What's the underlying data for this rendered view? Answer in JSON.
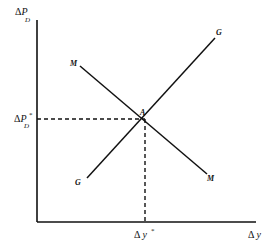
{
  "diagram": {
    "type": "economics-equilibrium",
    "colors": {
      "ink": "#111111",
      "background": "#ffffff"
    },
    "axes": {
      "y_label": {
        "delta": "Δ",
        "var": "P",
        "sub": "D"
      },
      "x_label": {
        "delta": "Δ",
        "var": "y"
      }
    },
    "curves": [
      {
        "id": "M",
        "label": "M",
        "label_end": "M",
        "direction": "downward-sloping"
      },
      {
        "id": "G",
        "label": "G",
        "label_end": "G",
        "direction": "upward-sloping"
      }
    ],
    "equilibrium": {
      "point_label": "A",
      "y_value_label": {
        "delta": "Δ",
        "var": "P",
        "sub": "D",
        "star": "*"
      },
      "x_value_label": {
        "delta": "Δ",
        "var": "y",
        "star": "*"
      }
    }
  }
}
